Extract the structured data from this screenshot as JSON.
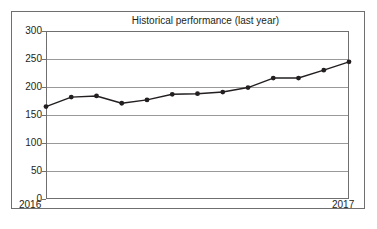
{
  "figure": {
    "background": "#ffffff",
    "frame_color": "#6f6f6f"
  },
  "chart_data": {
    "type": "line",
    "title": "Historical performance (last year)",
    "xlabel": "",
    "ylabel": "",
    "ylim": [
      0,
      300
    ],
    "yticks": [
      0,
      50,
      100,
      150,
      200,
      250,
      300
    ],
    "ytick_labels": [
      "0",
      "50",
      "100",
      "150",
      "200",
      "250",
      "300"
    ],
    "xtick_labels": [
      "2016",
      "2017"
    ],
    "grid": true,
    "grid_axis": "y",
    "legend": false,
    "marker": "circle",
    "line_color": "#231f20",
    "marker_color": "#231f20",
    "x": [
      0,
      1,
      2,
      3,
      4,
      5,
      6,
      7,
      8,
      9,
      10,
      11,
      12
    ],
    "values": [
      165,
      182,
      184,
      171,
      177,
      187,
      188,
      191,
      199,
      216,
      216,
      230,
      245
    ],
    "series": [
      {
        "name": "Historical performance",
        "values": [
          165,
          182,
          184,
          171,
          177,
          187,
          188,
          191,
          199,
          216,
          216,
          230,
          245
        ]
      }
    ]
  },
  "axes": {
    "plot_left_px": 46,
    "plot_right_px": 349,
    "plot_top_px": 31,
    "plot_bottom_px": 199
  }
}
